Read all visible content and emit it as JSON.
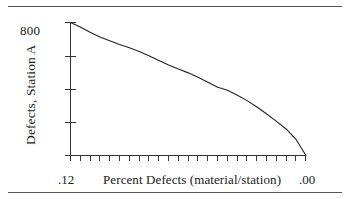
{
  "figure": {
    "top_rule": true,
    "bottom_rule": true
  },
  "chart_data": {
    "type": "line",
    "title": "",
    "xlabel": "Percent Defects (material/station)",
    "ylabel": "Defects, Station A",
    "x_tick_labels": [
      ".12",
      ".00"
    ],
    "y_tick_labels": [
      "800"
    ],
    "x_tick_count": 25,
    "y_tick_count": 5,
    "xlim": [
      0.12,
      0.0
    ],
    "ylim": [
      0,
      800
    ],
    "x_axis_reversed": true,
    "grid": false,
    "legend": null,
    "line_color": "#222222",
    "x": [
      0.12,
      0.115,
      0.11,
      0.105,
      0.1,
      0.095,
      0.09,
      0.085,
      0.08,
      0.075,
      0.07,
      0.065,
      0.06,
      0.055,
      0.05,
      0.045,
      0.04,
      0.035,
      0.03,
      0.025,
      0.02,
      0.015,
      0.01,
      0.005,
      0.0
    ],
    "values": [
      800,
      773,
      742,
      713,
      690,
      668,
      648,
      625,
      600,
      572,
      545,
      520,
      497,
      470,
      440,
      410,
      392,
      363,
      330,
      292,
      250,
      205,
      158,
      95,
      0
    ]
  },
  "axis_labels": {
    "y_top": "800",
    "y_title": "Defects, Station A",
    "x_left": ".12",
    "x_title": "Percent Defects (material/station)",
    "x_right": ".00"
  }
}
